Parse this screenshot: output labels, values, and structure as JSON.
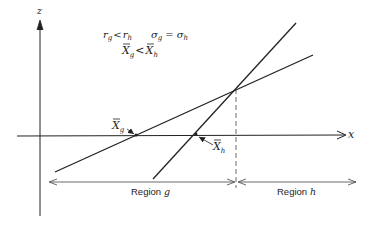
{
  "diagram": {
    "axes": {
      "z_label": "z",
      "x_label": "x"
    },
    "conditions": {
      "line1_left": "r",
      "line1_left_sub": "g",
      "line1_op": "<",
      "line1_right": "r",
      "line1_right_sub": "h",
      "line1b_left": "σ",
      "line1b_left_sub": "g",
      "line1b_op": "=",
      "line1b_right": "σ",
      "line1b_right_sub": "h",
      "line2_left": "X",
      "line2_left_sub": "g",
      "line2_op": "<",
      "line2_right": "X",
      "line2_right_sub": "h"
    },
    "points": {
      "xg_label": "X",
      "xg_sub": "g",
      "xh_label": "X",
      "xh_sub": "h"
    },
    "regions": {
      "g_label": "Region",
      "g_var": "g",
      "h_label": "Region",
      "h_var": "h"
    },
    "colors": {
      "ink": "#222222",
      "background": "#ffffff"
    }
  }
}
